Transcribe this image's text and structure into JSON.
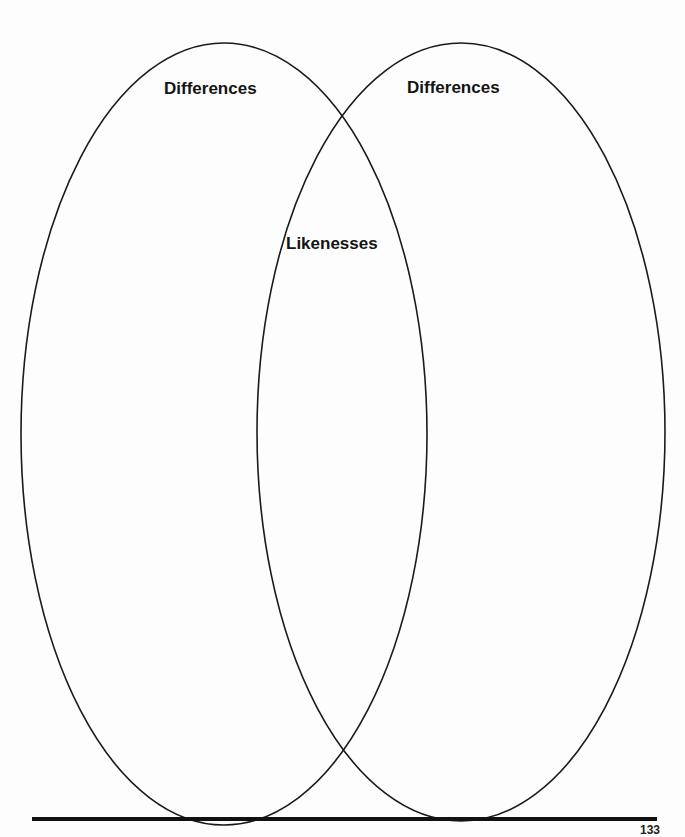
{
  "diagram": {
    "type": "venn",
    "sets": [
      {
        "id": "left",
        "label": "Differences",
        "shape": {
          "cx": 224,
          "cy": 434,
          "rx": 203,
          "ry": 391
        }
      },
      {
        "id": "right",
        "label": "Differences",
        "shape": {
          "cx": 461,
          "cy": 432,
          "rx": 204,
          "ry": 389
        }
      }
    ],
    "intersection": {
      "label": "Likenesses"
    },
    "stroke_color": "#1a1a1a",
    "background": "#fdfdfd"
  },
  "labels": {
    "left_differences": "Differences",
    "right_differences": "Differences",
    "likenesses": "Likenesses"
  },
  "footer": {
    "page_number": "133"
  }
}
